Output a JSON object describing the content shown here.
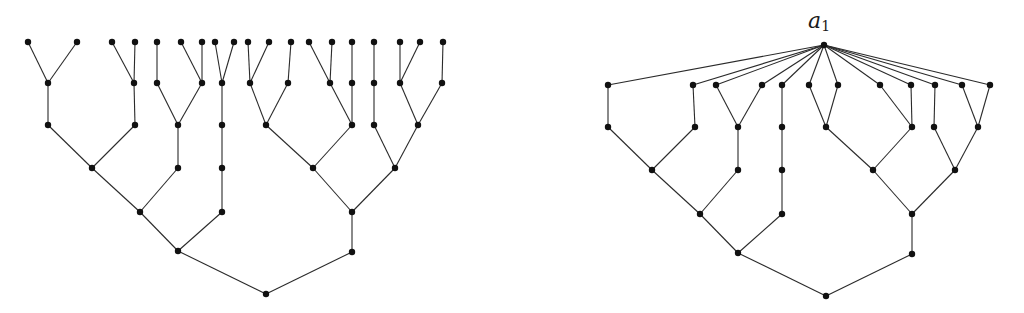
{
  "figure": {
    "label_root": {
      "text": "a",
      "subscript": "1",
      "x": 808,
      "y": 10
    },
    "colors": {
      "edge": "#2a2a2a",
      "node": "#111111",
      "background": "#ffffff"
    },
    "node_radius": 3.2
  },
  "trees": [
    {
      "name": "left-tree",
      "nodes": {
        "L1": [
          28,
          42
        ],
        "L2": [
          77,
          42
        ],
        "L3": [
          112,
          42
        ],
        "L4": [
          135,
          42
        ],
        "L5": [
          157,
          42
        ],
        "L6": [
          181,
          42
        ],
        "L7": [
          202,
          42
        ],
        "L8": [
          215,
          42
        ],
        "L9": [
          234,
          42
        ],
        "L10": [
          248,
          42
        ],
        "L11": [
          269,
          42
        ],
        "L12": [
          291,
          42
        ],
        "L13": [
          309,
          42
        ],
        "L14": [
          332,
          42
        ],
        "L15": [
          352,
          42
        ],
        "L16": [
          374,
          42
        ],
        "L17": [
          400,
          42
        ],
        "L18": [
          420,
          42
        ],
        "L19": [
          443,
          42
        ],
        "A1": [
          48,
          83
        ],
        "A2": [
          134,
          83
        ],
        "A3": [
          157,
          83
        ],
        "A4": [
          202,
          83
        ],
        "A5": [
          222,
          83
        ],
        "A6": [
          250,
          83
        ],
        "A7": [
          288,
          83
        ],
        "A8": [
          330,
          83
        ],
        "A9": [
          352,
          83
        ],
        "A10": [
          374,
          83
        ],
        "A11": [
          400,
          83
        ],
        "A12": [
          442,
          83
        ],
        "B1": [
          48,
          125
        ],
        "B2": [
          135,
          125
        ],
        "B3": [
          178,
          125
        ],
        "B4": [
          222,
          125
        ],
        "B5": [
          266,
          125
        ],
        "B6": [
          352,
          125
        ],
        "B7": [
          374,
          125
        ],
        "B8": [
          418,
          125
        ],
        "C1": [
          92,
          168
        ],
        "C2": [
          178,
          168
        ],
        "C3": [
          222,
          168
        ],
        "C4": [
          313,
          168
        ],
        "C5": [
          395,
          168
        ],
        "D1": [
          140,
          212
        ],
        "D2": [
          222,
          212
        ],
        "D3": [
          352,
          212
        ],
        "E1": [
          178,
          251
        ],
        "E2": [
          352,
          252
        ],
        "R": [
          266,
          294
        ]
      },
      "edges": [
        [
          "L1",
          "A1"
        ],
        [
          "L2",
          "A1"
        ],
        [
          "L3",
          "A2"
        ],
        [
          "L4",
          "A2"
        ],
        [
          "L5",
          "A3"
        ],
        [
          "L6",
          "A4"
        ],
        [
          "L7",
          "A4"
        ],
        [
          "L8",
          "A5"
        ],
        [
          "L9",
          "A5"
        ],
        [
          "L10",
          "A6"
        ],
        [
          "L11",
          "A6"
        ],
        [
          "L12",
          "A7"
        ],
        [
          "L13",
          "A8"
        ],
        [
          "L14",
          "A8"
        ],
        [
          "L15",
          "A9"
        ],
        [
          "L16",
          "A10"
        ],
        [
          "L17",
          "A11"
        ],
        [
          "L18",
          "A11"
        ],
        [
          "L19",
          "A12"
        ],
        [
          "A1",
          "B1"
        ],
        [
          "A2",
          "B2"
        ],
        [
          "A3",
          "B3"
        ],
        [
          "A4",
          "B3"
        ],
        [
          "A5",
          "B4"
        ],
        [
          "A6",
          "B5"
        ],
        [
          "A7",
          "B5"
        ],
        [
          "A8",
          "B6"
        ],
        [
          "A9",
          "B6"
        ],
        [
          "A10",
          "B7"
        ],
        [
          "A11",
          "B8"
        ],
        [
          "A12",
          "B8"
        ],
        [
          "B1",
          "C1"
        ],
        [
          "B2",
          "C1"
        ],
        [
          "B3",
          "C2"
        ],
        [
          "B4",
          "C3"
        ],
        [
          "B5",
          "C4"
        ],
        [
          "B6",
          "C4"
        ],
        [
          "B7",
          "C5"
        ],
        [
          "B8",
          "C5"
        ],
        [
          "C1",
          "D1"
        ],
        [
          "C2",
          "D1"
        ],
        [
          "C3",
          "D2"
        ],
        [
          "C4",
          "D3"
        ],
        [
          "C5",
          "D3"
        ],
        [
          "D1",
          "E1"
        ],
        [
          "D2",
          "E1"
        ],
        [
          "D3",
          "E2"
        ],
        [
          "E1",
          "R"
        ],
        [
          "E2",
          "R"
        ]
      ]
    },
    {
      "name": "right-tree",
      "nodes": {
        "T": [
          824,
          45
        ],
        "P1": [
          608,
          85
        ],
        "P2": [
          693,
          85
        ],
        "P3": [
          716,
          85
        ],
        "P4": [
          762,
          85
        ],
        "P5": [
          782,
          85
        ],
        "P6": [
          809,
          85
        ],
        "P7": [
          838,
          85
        ],
        "P8": [
          880,
          85
        ],
        "P9": [
          911,
          85
        ],
        "P10": [
          935,
          85
        ],
        "P11": [
          962,
          85
        ],
        "P12": [
          990,
          85
        ],
        "Q1": [
          608,
          127
        ],
        "Q2": [
          695,
          127
        ],
        "Q3": [
          738,
          127
        ],
        "Q4": [
          782,
          127
        ],
        "Q5": [
          826,
          127
        ],
        "Q6": [
          912,
          127
        ],
        "Q7": [
          934,
          127
        ],
        "Q8": [
          978,
          127
        ],
        "S1": [
          652,
          170
        ],
        "S2": [
          738,
          170
        ],
        "S3": [
          782,
          170
        ],
        "S4": [
          873,
          170
        ],
        "S5": [
          955,
          170
        ],
        "U1": [
          700,
          214
        ],
        "U2": [
          782,
          214
        ],
        "U3": [
          912,
          214
        ],
        "V1": [
          738,
          253
        ],
        "V2": [
          912,
          254
        ],
        "W": [
          826,
          296
        ]
      },
      "edges": [
        [
          "T",
          "P1"
        ],
        [
          "T",
          "P2"
        ],
        [
          "T",
          "P3"
        ],
        [
          "T",
          "P4"
        ],
        [
          "T",
          "P5"
        ],
        [
          "T",
          "P6"
        ],
        [
          "T",
          "P7"
        ],
        [
          "T",
          "P8"
        ],
        [
          "T",
          "P9"
        ],
        [
          "T",
          "P10"
        ],
        [
          "T",
          "P11"
        ],
        [
          "T",
          "P12"
        ],
        [
          "P1",
          "Q1"
        ],
        [
          "P2",
          "Q2"
        ],
        [
          "P3",
          "Q3"
        ],
        [
          "P4",
          "Q3"
        ],
        [
          "P5",
          "Q4"
        ],
        [
          "P6",
          "Q5"
        ],
        [
          "P7",
          "Q5"
        ],
        [
          "P8",
          "Q6"
        ],
        [
          "P9",
          "Q6"
        ],
        [
          "P10",
          "Q7"
        ],
        [
          "P11",
          "Q8"
        ],
        [
          "P12",
          "Q8"
        ],
        [
          "Q1",
          "S1"
        ],
        [
          "Q2",
          "S1"
        ],
        [
          "Q3",
          "S2"
        ],
        [
          "Q4",
          "S3"
        ],
        [
          "Q5",
          "S4"
        ],
        [
          "Q6",
          "S4"
        ],
        [
          "Q7",
          "S5"
        ],
        [
          "Q8",
          "S5"
        ],
        [
          "S1",
          "U1"
        ],
        [
          "S2",
          "U1"
        ],
        [
          "S3",
          "U2"
        ],
        [
          "S4",
          "U3"
        ],
        [
          "S5",
          "U3"
        ],
        [
          "U1",
          "V1"
        ],
        [
          "U2",
          "V1"
        ],
        [
          "U3",
          "V2"
        ],
        [
          "V1",
          "W"
        ],
        [
          "V2",
          "W"
        ]
      ]
    }
  ]
}
